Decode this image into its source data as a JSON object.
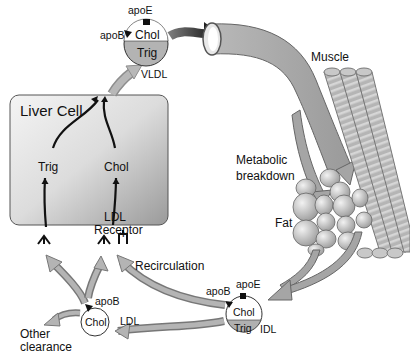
{
  "diagram": {
    "type": "lipoprotein-metabolism-flow",
    "nodes": {
      "liver_cell": {
        "title": "Liver Cell",
        "trig": "Trig",
        "chol": "Chol",
        "receptor_line1": "LDL",
        "receptor_line2": "Receptor"
      },
      "vldl": {
        "name": "VLDL",
        "apoE": "apoE",
        "apoB": "apoB",
        "chol": "Chol",
        "trig": "Trig"
      },
      "idl": {
        "name": "IDL",
        "apoE": "apoE",
        "apoB": "apoB",
        "chol": "Chol",
        "trig": "Trig"
      },
      "ldl": {
        "name": "LDL",
        "apoB": "apoB",
        "chol": "Chol"
      },
      "muscle": {
        "label": "Muscle"
      },
      "fat": {
        "label": "Fat"
      },
      "metabolic": {
        "line1": "Metabolic",
        "line2": "breakdown"
      },
      "recirculation": {
        "label": "Recirculation"
      },
      "other_clearance": {
        "line1": "Other",
        "line2": "clearance"
      }
    },
    "edges": [
      {
        "from": "liver_cell",
        "to": "vldl"
      },
      {
        "from": "vldl",
        "to": "blood_vessel"
      },
      {
        "from": "blood_vessel",
        "to": "muscle"
      },
      {
        "from": "blood_vessel",
        "to": "fat"
      },
      {
        "from": "fat",
        "to": "idl"
      },
      {
        "from": "idl",
        "to": "ldl"
      },
      {
        "from": "idl",
        "to": "liver_cell",
        "label": "Recirculation"
      },
      {
        "from": "ldl",
        "to": "liver_cell"
      },
      {
        "from": "ldl",
        "to": "other_clearance"
      }
    ]
  }
}
